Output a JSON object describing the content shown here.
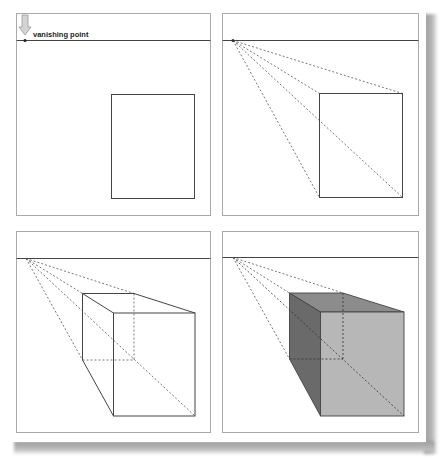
{
  "figure": {
    "panels": [
      {
        "id": "step-1",
        "shading": false,
        "annotation": "vanishing point",
        "shows_arrow": true,
        "guides": false,
        "cube": false
      },
      {
        "id": "step-2",
        "shading": false,
        "annotation": "",
        "shows_arrow": false,
        "guides": true,
        "cube": false
      },
      {
        "id": "step-3",
        "shading": false,
        "annotation": "",
        "shows_arrow": false,
        "guides": true,
        "cube": true
      },
      {
        "id": "step-4",
        "shading": true,
        "annotation": "",
        "shows_arrow": false,
        "guides": true,
        "cube": true
      }
    ],
    "colors": {
      "panel_border": "#aaaaaa",
      "horizon": "#444444",
      "line": "#444444",
      "guide": "#555555",
      "face_top": "#8c8c8c",
      "face_side": "#6a6a6a",
      "face_front": "#b7b7b7",
      "arrow": "#c4c4c4"
    }
  },
  "labels": {
    "vanishing_point": "vanishing point",
    "page_marks": "·   ·"
  }
}
